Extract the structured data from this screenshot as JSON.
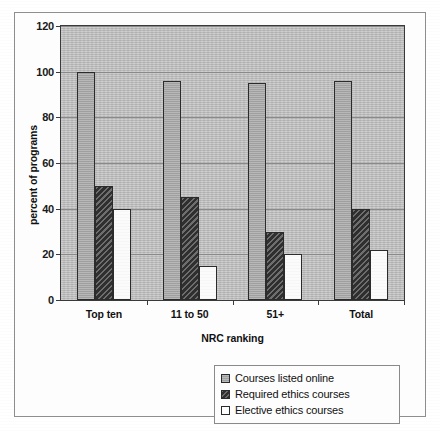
{
  "chart_data": {
    "type": "bar",
    "title": "",
    "xlabel": "NRC ranking",
    "ylabel": "percent of programs",
    "categories": [
      "Top ten",
      "11 to 50",
      "51+",
      "Total"
    ],
    "series": [
      {
        "name": "Courses listed online",
        "values": [
          100,
          96,
          95,
          96
        ],
        "swatch": "light-gray"
      },
      {
        "name": "Required ethics courses",
        "values": [
          50,
          45,
          30,
          40
        ],
        "swatch": "dark-hatched"
      },
      {
        "name": "Elective ethics courses",
        "values": [
          40,
          15,
          20,
          22
        ],
        "swatch": "white"
      }
    ],
    "ylim": [
      0,
      120
    ],
    "yticks": [
      0,
      20,
      40,
      60,
      80,
      100,
      120
    ],
    "ytick_labels": [
      "0",
      "20",
      "40",
      "60",
      "80",
      "100",
      "120"
    ],
    "grid": true,
    "legend_position": "bottom-right",
    "plot_background": "#b9b9b9",
    "frame_color": "#3a3a3a"
  },
  "legend": {
    "items": [
      {
        "label": "Courses listed online"
      },
      {
        "label": "Required ethics courses"
      },
      {
        "label": "Elective ethics courses"
      }
    ]
  }
}
